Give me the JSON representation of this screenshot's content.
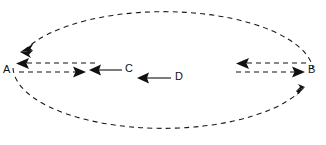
{
  "figure": {
    "type": "physics-vector-diagram",
    "canvas": {
      "width": 326,
      "height": 145,
      "background": "#ffffff"
    },
    "stroke_color": "#111111",
    "labels": {
      "point_a": "A",
      "point_b": "B",
      "vector_c": "C",
      "vector_d": "D"
    },
    "ellipse": {
      "center_x": 163,
      "center_y": 68,
      "radius_x": 150,
      "radius_y": 62,
      "style": "dashed",
      "direction_markers": [
        {
          "name": "upper-left-arrowhead",
          "x": 26,
          "y": 46,
          "points": "down-left"
        },
        {
          "name": "lower-right-arrowhead",
          "x": 301,
          "y": 94,
          "points": "up-right"
        }
      ]
    },
    "vectors": [
      {
        "name": "a-inbound-dashed",
        "style": "dashed",
        "from_x": 95,
        "from_y": 63,
        "to_x": 19,
        "to_y": 63,
        "points": "left"
      },
      {
        "name": "a-outbound-dashed",
        "style": "dashed",
        "from_x": 19,
        "from_y": 72,
        "to_x": 84,
        "to_y": 72,
        "points": "right"
      },
      {
        "name": "c-vector-solid",
        "style": "solid",
        "from_x": 122,
        "from_y": 70,
        "to_x": 90,
        "to_y": 70,
        "points": "left"
      },
      {
        "name": "d-vector-solid",
        "style": "solid",
        "from_x": 170,
        "from_y": 78,
        "to_x": 138,
        "to_y": 78,
        "points": "left"
      },
      {
        "name": "b-inbound-dashed-top",
        "style": "dashed",
        "from_x": 306,
        "from_y": 63,
        "to_x": 236,
        "to_y": 63,
        "points": "left"
      },
      {
        "name": "b-outbound-dashed-bottom",
        "style": "dashed",
        "from_x": 236,
        "from_y": 72,
        "to_x": 303,
        "to_y": 72,
        "points": "right"
      }
    ],
    "label_positions": {
      "point_a": {
        "x": 8,
        "y": 70
      },
      "point_b": {
        "x": 312,
        "y": 70
      },
      "vector_c": {
        "x": 128,
        "y": 69
      },
      "vector_d": {
        "x": 178,
        "y": 77
      }
    }
  }
}
